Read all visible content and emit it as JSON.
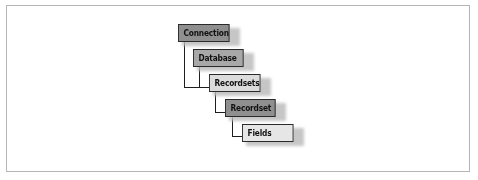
{
  "diagram": {
    "type": "object-hierarchy",
    "nodes": [
      {
        "id": "connection",
        "label": "Connection",
        "fill": "#8f8f8f",
        "x": 178,
        "y": 24,
        "w": 56
      },
      {
        "id": "database",
        "label": "Database",
        "fill": "#a8a8a8",
        "x": 193,
        "y": 49,
        "w": 55
      },
      {
        "id": "recordsets",
        "label": "Recordsets",
        "fill": "#dcdcdc",
        "x": 209,
        "y": 74,
        "w": 56
      },
      {
        "id": "recordset",
        "label": "Recordset",
        "fill": "#8f8f8f",
        "x": 225,
        "y": 99,
        "w": 55
      },
      {
        "id": "fields",
        "label": "Fields",
        "fill": "#e6e6e6",
        "x": 242,
        "y": 124,
        "w": 56
      }
    ],
    "edges": [
      {
        "from": "connection",
        "to": "recordsets"
      },
      {
        "from": "database",
        "to": "recordsets"
      },
      {
        "from": "recordsets",
        "to": "recordset"
      },
      {
        "from": "recordset",
        "to": "fields"
      }
    ],
    "colors": {
      "border": "#2a2a2a",
      "shadow": "#bdbdbd",
      "frame": "#b5b5b5"
    }
  }
}
